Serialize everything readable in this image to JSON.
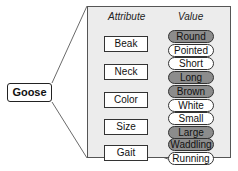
{
  "diagram": {
    "root": "Goose",
    "headers": {
      "attribute": "Attribute",
      "value": "Value"
    },
    "attributes": [
      {
        "label": "Beak",
        "values": [
          {
            "label": "Round",
            "selected": true
          },
          {
            "label": "Pointed",
            "selected": false
          }
        ]
      },
      {
        "label": "Neck",
        "values": [
          {
            "label": "Short",
            "selected": false
          },
          {
            "label": "Long",
            "selected": true
          }
        ]
      },
      {
        "label": "Color",
        "values": [
          {
            "label": "Brown",
            "selected": true
          },
          {
            "label": "White",
            "selected": false
          }
        ]
      },
      {
        "label": "Size",
        "values": [
          {
            "label": "Small",
            "selected": false
          },
          {
            "label": "Large",
            "selected": true
          }
        ]
      },
      {
        "label": "Gait",
        "values": [
          {
            "label": "Waddling",
            "selected": true
          },
          {
            "label": "Running",
            "selected": false
          }
        ]
      }
    ],
    "colors": {
      "selected_fill": "#8c8c8c",
      "unselected_fill": "#ffffff",
      "panel_fill": "#ececec"
    }
  }
}
